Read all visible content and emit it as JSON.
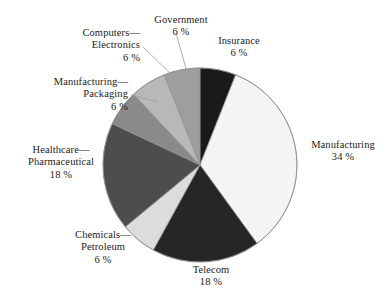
{
  "chart_data": {
    "type": "pie",
    "title": "",
    "subtitle": "",
    "xlabel": "",
    "ylabel": "",
    "legend_position": "none",
    "grid": false,
    "labels_outside": true,
    "value_suffix": "%",
    "total": 100,
    "categories": [
      "Insurance",
      "Manufacturing",
      "Telecom",
      "Chemicals—Petroleum",
      "Healthcare—Pharmaceutical",
      "Manufacturing—Packaging",
      "Computers—Electronics",
      "Government"
    ],
    "values": [
      6,
      34,
      18,
      6,
      18,
      6,
      6,
      6
    ],
    "slices": [
      {
        "id": "insurance",
        "name": "Insurance",
        "name_line1": "Insurance",
        "name_line2": "",
        "value": 6,
        "percent_text": "6 %",
        "color": "#1a1a1a",
        "start_deg": 0,
        "end_deg": 21.6
      },
      {
        "id": "manufacturing",
        "name": "Manufacturing",
        "name_line1": "Manufacturing",
        "name_line2": "",
        "value": 34,
        "percent_text": "34 %",
        "color": "#f4f4f2",
        "start_deg": 21.6,
        "end_deg": 144.0
      },
      {
        "id": "telecom",
        "name": "Telecom",
        "name_line1": "Telecom",
        "name_line2": "",
        "value": 18,
        "percent_text": "18 %",
        "color": "#262626",
        "start_deg": 144.0,
        "end_deg": 208.8
      },
      {
        "id": "chemicals-petroleum",
        "name": "Chemicals—Petroleum",
        "name_line1": "Chemicals—",
        "name_line2": "Petroleum",
        "value": 6,
        "percent_text": "6 %",
        "color": "#dcdcda",
        "start_deg": 208.8,
        "end_deg": 230.4
      },
      {
        "id": "healthcare-pharmaceutical",
        "name": "Healthcare—Pharmaceutical",
        "name_line1": "Healthcare—",
        "name_line2": "Pharmaceutical",
        "value": 18,
        "percent_text": "18 %",
        "color": "#4d4d4d",
        "start_deg": 230.4,
        "end_deg": 295.2
      },
      {
        "id": "manufacturing-packaging",
        "name": "Manufacturing—Packaging",
        "name_line1": "Manufacturing—",
        "name_line2": "Packaging",
        "value": 6,
        "percent_text": "6 %",
        "color": "#8a8a8a",
        "start_deg": 295.2,
        "end_deg": 316.8
      },
      {
        "id": "computers-electronics",
        "name": "Computers—Electronics",
        "name_line1": "Computers—",
        "name_line2": "Electronics",
        "value": 6,
        "percent_text": "6 %",
        "color": "#b8b8b6",
        "start_deg": 316.8,
        "end_deg": 338.4
      },
      {
        "id": "government",
        "name": "Government",
        "name_line1": "Government",
        "name_line2": "",
        "value": 6,
        "percent_text": "6 %",
        "color": "#9e9e9e",
        "start_deg": 338.4,
        "end_deg": 360.0
      }
    ],
    "colors": {
      "outline": "#8c8c8c",
      "leader_line": "#9a9a9a",
      "text": "#1c1c1c",
      "background": "#ffffff"
    }
  }
}
